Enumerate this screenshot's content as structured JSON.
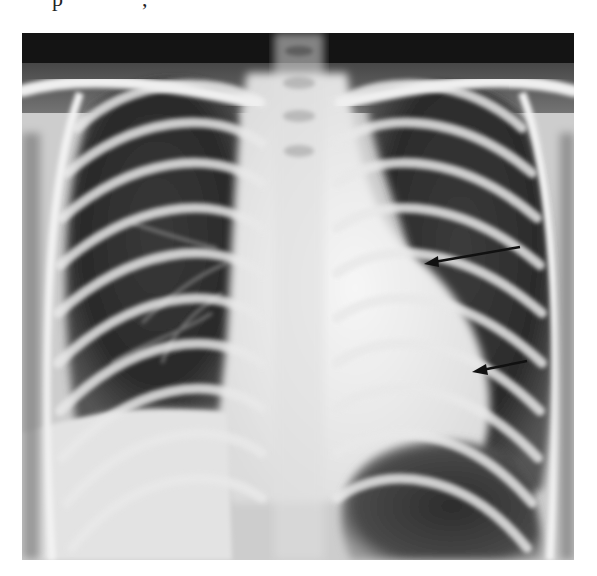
{
  "page": {
    "top_text_fragment": {
      "glyph_1": "p",
      "glyph_2": ","
    }
  },
  "figure": {
    "type": "radiograph",
    "annotations": [
      {
        "kind": "arrow",
        "color": "#111111",
        "tail": [
          520,
          247
        ],
        "head": [
          424,
          262
        ],
        "position": "upper left cardiac border"
      },
      {
        "kind": "arrow",
        "color": "#111111",
        "tail": [
          527,
          361
        ],
        "head": [
          472,
          371
        ],
        "position": "lower left cardiac border"
      }
    ],
    "colors": {
      "lung_field": "#2e2e2e",
      "bone": "#e9e9e9",
      "mediastinum": "#f0f0f0",
      "gastric_bubble": "#3a3a3a",
      "border": "#ffffff"
    }
  }
}
